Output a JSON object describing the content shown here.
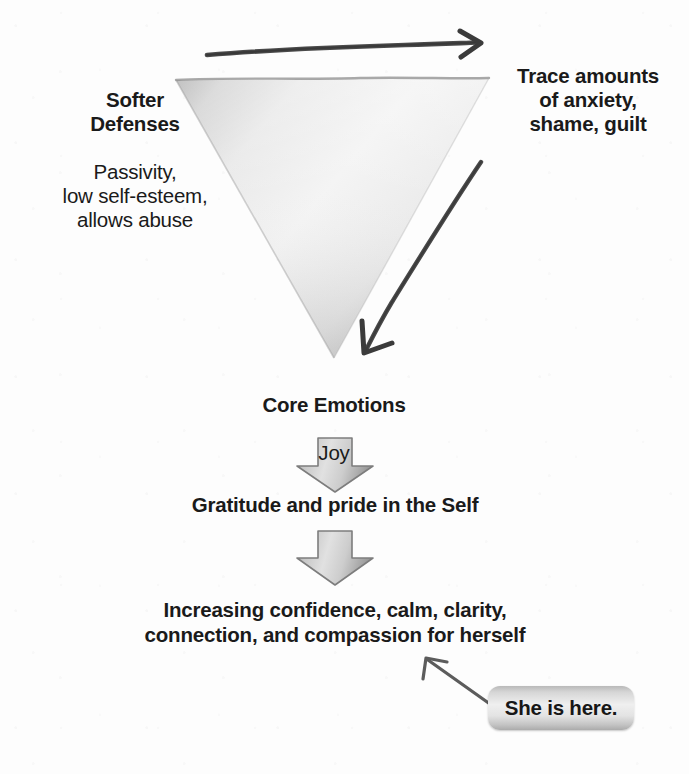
{
  "diagram": {
    "labels": {
      "left_heading": "Softer\nDefenses",
      "left_body": "Passivity,\nlow self-esteem,\nallows abuse",
      "right_block": "Trace amounts\nof anxiety,\nshame, guilt",
      "core_heading": "Core Emotions",
      "core_body": "Joy",
      "gratitude": "Gratitude and pride in the Self",
      "increasing": "Increasing confidence, calm, clarity,\nconnection, and compassion for herself",
      "callout": "She is here."
    },
    "shapes": {
      "triangle_name": "inverted-triangle",
      "top_arrow_name": "top-rightward-arrow",
      "side_arrow_name": "descending-diagonal-arrow",
      "block_arrow_1_name": "downward-block-arrow-core-to-gratitude",
      "block_arrow_2_name": "downward-block-arrow-gratitude-to-increasing",
      "callout_arrow_name": "callout-pointer-arrow"
    },
    "colors": {
      "background": "#fdfdfd",
      "text": "#1a1a1a",
      "triangle_light": "#f4f4f4",
      "triangle_mid": "#dcdcdc",
      "triangle_dark": "#9c9c9c",
      "block_arrow_fill": "#c9c9c9",
      "block_arrow_stroke": "#7d7d7d",
      "hand_arrow": "#4a4a4a",
      "callout_fill": "#dcdcdc"
    }
  }
}
